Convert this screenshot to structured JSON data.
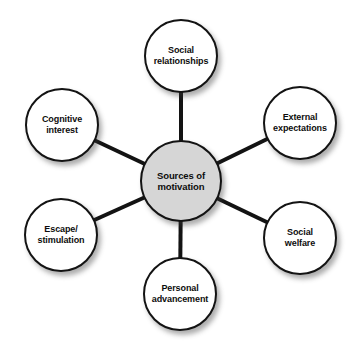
{
  "diagram": {
    "type": "hub-and-spoke",
    "background_color": "#ffffff",
    "line_color": "#131313",
    "center": {
      "id": "sources-of-motivation",
      "label": "Sources of\nmotivation",
      "fill_color": "#d6d6d6",
      "cx": 181,
      "cy": 181,
      "r": 41
    },
    "nodes": [
      {
        "id": "social-relationships",
        "label": "Social\nrelationships",
        "fill_color": "#ffffff",
        "position": "top",
        "cx": 181,
        "cy": 56,
        "r": 37
      },
      {
        "id": "external-expectations",
        "label": "External\nexpectations",
        "fill_color": "#ffffff",
        "position": "upper-right",
        "cx": 300,
        "cy": 123,
        "r": 37
      },
      {
        "id": "social-welfare",
        "label": "Social\nwelfare",
        "fill_color": "#ffffff",
        "position": "lower-right",
        "cx": 300,
        "cy": 238,
        "r": 37
      },
      {
        "id": "personal-advancement",
        "label": "Personal\nadvancement",
        "fill_color": "#ffffff",
        "position": "bottom",
        "cx": 180,
        "cy": 294,
        "r": 37
      },
      {
        "id": "escape-stimulation",
        "label": "Escape/\nstimulation",
        "fill_color": "#ffffff",
        "position": "lower-left",
        "cx": 61,
        "cy": 235,
        "r": 37
      },
      {
        "id": "cognitive-interest",
        "label": "Cognitive\ninterest",
        "fill_color": "#ffffff",
        "position": "upper-left",
        "cx": 62,
        "cy": 125,
        "r": 37
      }
    ],
    "connectors": [
      {
        "id": "connector-social-relationships",
        "x1": 181,
        "y1": 181,
        "x2": 181,
        "y2": 56
      },
      {
        "id": "connector-external-expectations",
        "x1": 181,
        "y1": 181,
        "x2": 300,
        "y2": 123
      },
      {
        "id": "connector-social-welfare",
        "x1": 181,
        "y1": 181,
        "x2": 300,
        "y2": 238
      },
      {
        "id": "connector-personal-advancement",
        "x1": 181,
        "y1": 181,
        "x2": 180,
        "y2": 294
      },
      {
        "id": "connector-escape-stimulation",
        "x1": 181,
        "y1": 181,
        "x2": 61,
        "y2": 235
      },
      {
        "id": "connector-cognitive-interest",
        "x1": 181,
        "y1": 181,
        "x2": 62,
        "y2": 125
      }
    ]
  }
}
